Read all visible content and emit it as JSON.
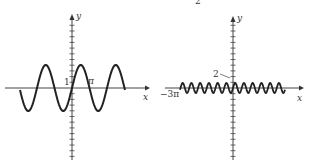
{
  "top_fragment": "2",
  "chart_data": [
    {
      "type": "line",
      "title": "",
      "xlabel": "x",
      "ylabel": "y",
      "annotations": [
        "1",
        "π"
      ],
      "function": "y = a·sin(b·x), large amplitude, ~3 periods visible",
      "series": [
        {
          "name": "left-sine",
          "amplitude_px": 23,
          "period_px": 35,
          "x_start_px": 20,
          "x_end_px": 125
        }
      ],
      "grid": false
    },
    {
      "type": "line",
      "title": "",
      "xlabel": "x",
      "ylabel": "y",
      "annotations": [
        "2",
        "−3π"
      ],
      "function": "y = a·sin(b·x), small amplitude, ~12 periods visible",
      "series": [
        {
          "name": "right-sine",
          "amplitude_px": 5,
          "period_px": 8.75,
          "x_start_px": 180,
          "x_end_px": 285
        }
      ],
      "grid": false
    }
  ],
  "left": {
    "xlabel": "x",
    "ylabel": "y",
    "tick_one": "1",
    "pi": "π"
  },
  "right": {
    "xlabel": "x",
    "ylabel": "y",
    "tick_two": "2",
    "neg3pi": "−3π"
  }
}
